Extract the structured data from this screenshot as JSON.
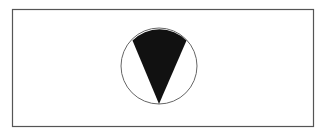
{
  "figure": {
    "frame": {
      "x": 12.5,
      "y": 9.5,
      "width": 301,
      "height": 117,
      "stroke": "#555555",
      "stroke_width": 1.2
    },
    "circle": {
      "cx": 159,
      "cy": 66,
      "r": 38,
      "stroke": "#666666",
      "stroke_width": 1,
      "fill": "#ffffff"
    },
    "sector": {
      "fill": "#111111",
      "apex": {
        "x": 159,
        "y": 104
      },
      "left_point": {
        "x": 132.5,
        "y": 40.5
      },
      "right_point": {
        "x": 186.5,
        "y": 40.5
      }
    }
  },
  "colors": {
    "background": "#ffffff",
    "frame": "#555555",
    "circle_outline": "#666666",
    "sector_fill": "#111111"
  }
}
